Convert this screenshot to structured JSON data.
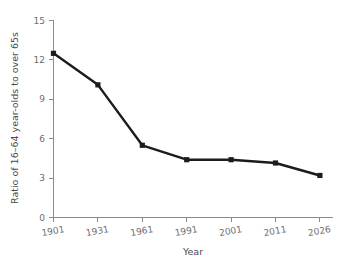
{
  "chart_data": {
    "type": "line",
    "title": "",
    "xlabel": "Year",
    "ylabel": "Ratio of 16–64 year-olds to over 65s",
    "categories": [
      "1901",
      "1931",
      "1961",
      "1991",
      "2001",
      "2011",
      "2026"
    ],
    "values": [
      12.5,
      10.1,
      5.5,
      4.4,
      4.4,
      4.15,
      3.2
    ],
    "series": [
      {
        "name": "Ratio of 16–64 year-olds to over 65s",
        "values": [
          12.5,
          10.1,
          5.5,
          4.4,
          4.4,
          4.15,
          3.2
        ]
      }
    ],
    "x_tick_labels": [
      "1901",
      "1931",
      "1961",
      "1991",
      "2001",
      "2011",
      "2026"
    ],
    "y_tick_labels": [
      "0",
      "3",
      "6",
      "9",
      "12",
      "15"
    ],
    "y_ticks": [
      0,
      3,
      6,
      9,
      12,
      15
    ],
    "ylim": [
      0,
      15
    ],
    "grid": false,
    "legend": false,
    "legend_position": "none",
    "marker": "square",
    "line_color": "#1c1c1c",
    "axis_color": "#8c8c8e",
    "tick_label_color": "#6d6d70",
    "background_color": "#ffffff",
    "x_tick_label_rotation": -10
  }
}
